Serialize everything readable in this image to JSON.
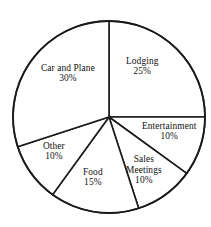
{
  "chart_data": {
    "type": "pie",
    "title": "",
    "subtitle": "",
    "xlabel": "",
    "ylabel": "",
    "legend_position": "none",
    "grid": false,
    "labels_inside": true,
    "start_angle_deg": 0,
    "direction": "clockwise",
    "total": 100,
    "value_suffix": "%",
    "categories": [
      "Lodging",
      "Entertainment",
      "Sales Meetings",
      "Food",
      "Other",
      "Car and Plane"
    ],
    "values": [
      25,
      10,
      10,
      15,
      10,
      30
    ],
    "slices": [
      {
        "name": "Lodging",
        "value": 25,
        "value_text": "25%",
        "label_lines": [
          "Lodging",
          "25%"
        ],
        "start_deg": 0,
        "end_deg": 90,
        "fill": "#ffffff",
        "stroke": "#1a1a1a",
        "label_x": 142,
        "label_y": 66
      },
      {
        "name": "Entertainment",
        "value": 10,
        "value_text": "10%",
        "label_lines": [
          "Entertainment",
          "10%"
        ],
        "start_deg": 90,
        "end_deg": 126,
        "fill": "#ffffff",
        "stroke": "#1a1a1a",
        "label_x": 169,
        "label_y": 131
      },
      {
        "name": "Sales Meetings",
        "value": 10,
        "value_text": "10%",
        "label_lines": [
          "Sales",
          "Meetings",
          "10%"
        ],
        "start_deg": 126,
        "end_deg": 162,
        "fill": "#ffffff",
        "stroke": "#1a1a1a",
        "label_x": 144,
        "label_y": 170
      },
      {
        "name": "Food",
        "value": 15,
        "value_text": "15%",
        "label_lines": [
          "Food",
          "15%"
        ],
        "start_deg": 162,
        "end_deg": 216,
        "fill": "#ffffff",
        "stroke": "#1a1a1a",
        "label_x": 93,
        "label_y": 177
      },
      {
        "name": "Other",
        "value": 10,
        "value_text": "10%",
        "label_lines": [
          "Other",
          "10%"
        ],
        "start_deg": 216,
        "end_deg": 252,
        "fill": "#ffffff",
        "stroke": "#1a1a1a",
        "label_x": 54,
        "label_y": 151
      },
      {
        "name": "Car and Plane",
        "value": 30,
        "value_text": "30%",
        "label_lines": [
          "Car and Plane",
          "30%"
        ],
        "start_deg": 252,
        "end_deg": 360,
        "fill": "#ffffff",
        "stroke": "#1a1a1a",
        "label_x": 68,
        "label_y": 73
      }
    ],
    "geometry": {
      "center_x": 109,
      "center_y": 117,
      "radius": 96
    }
  }
}
